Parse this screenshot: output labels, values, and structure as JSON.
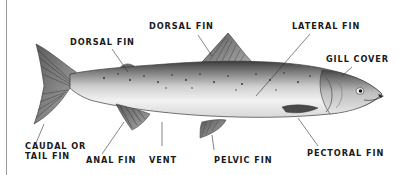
{
  "diagram": {
    "labels": {
      "dorsal_fin_front": "DORSAL FIN",
      "dorsal_fin_rear": "DORSAL FIN",
      "lateral_fin": "LATERAL FIN",
      "gill_cover": "GILL COVER",
      "caudal_fin_line1": "CAUDAL OR",
      "caudal_fin_line2": "TAIL FIN",
      "anal_fin": "ANAL FIN",
      "vent": "VENT",
      "pelvic_fin": "PELVIC FIN",
      "pectoral_fin": "PECTORAL FIN"
    },
    "colors": {
      "background": "#ffffff",
      "label_text": "#1a1a1a",
      "leader_line": "#333333",
      "fish_dark": "#3a3a3a",
      "fish_mid": "#9a9a9a",
      "fish_light": "#eeeeee"
    }
  }
}
